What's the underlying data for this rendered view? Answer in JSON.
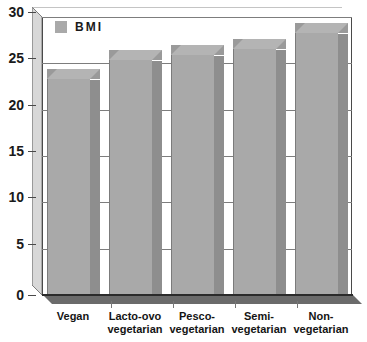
{
  "chart_data": {
    "type": "bar",
    "title": "",
    "subtitle": "",
    "xlabel": "",
    "ylabel": "",
    "categories": [
      "Vegan",
      "Lacto-ovo\nvegetarian",
      "Pesco-\nvegetarian",
      "Semi-\nvegetarian",
      "Non-\nvegetarian"
    ],
    "category_lines": [
      [
        "Vegan",
        ""
      ],
      [
        "Lacto-ovo",
        "vegetarian"
      ],
      [
        "Pesco-",
        "vegetarian"
      ],
      [
        "Semi-",
        "vegetarian"
      ],
      [
        "Non-",
        "vegetarian"
      ]
    ],
    "series": [
      {
        "name": "BMI",
        "values": [
          23.3,
          25.4,
          25.9,
          26.6,
          28.3
        ],
        "color": "#a9a9a9"
      }
    ],
    "ylim": [
      0,
      30
    ],
    "yticks": [
      0,
      5,
      10,
      15,
      20,
      25,
      30
    ],
    "ytick_labels": [
      "0",
      "5",
      "10",
      "15",
      "20",
      "25",
      "30"
    ],
    "grid": true,
    "grid_axis": "y",
    "legend": {
      "position": "top-left-inside",
      "entries": [
        {
          "label": "BMI",
          "color": "#a9a9a9"
        }
      ]
    },
    "style": {
      "bar_style": "3d",
      "bar_face_color": "#a9a9a9",
      "bar_top_color": "#b4b4b4",
      "bar_side_color": "#8e8e8e",
      "grid_color": "#7d7d7d",
      "axis_color": "#4a4a4a",
      "background": "#ffffff",
      "text_color": "#1a1a1a"
    }
  }
}
